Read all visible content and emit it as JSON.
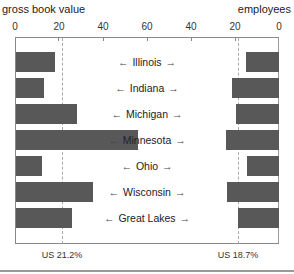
{
  "chart_data": {
    "type": "bar",
    "orientation": "horizontal-butterfly",
    "categories": [
      "Illinois",
      "Indiana",
      "Michigan",
      "Minnesota",
      "Ohio",
      "Wisconsin",
      "Great Lakes"
    ],
    "series": [
      {
        "name": "gross book value",
        "side": "left",
        "values": [
          17.7,
          12.7,
          27.7,
          55.5,
          11.8,
          35.0,
          25.5
        ]
      },
      {
        "name": "employees",
        "side": "right",
        "values": [
          15.0,
          21.4,
          19.5,
          24.1,
          14.5,
          23.6,
          18.6
        ]
      }
    ],
    "left_title": "gross book value",
    "right_title": "employees",
    "left_ticks": [
      "0",
      "20",
      "40",
      "60"
    ],
    "right_ticks": [
      "40",
      "20",
      "0"
    ],
    "xlim_left": [
      0,
      60
    ],
    "xlim_right": [
      0,
      60
    ],
    "reference_lines": [
      {
        "side": "left",
        "value": 21.2,
        "label": "US 21.2%"
      },
      {
        "side": "right",
        "value": 18.7,
        "label": "US 18.7%"
      }
    ],
    "arrow_left": "←",
    "arrow_right": "→",
    "bar_color": "#585858",
    "grid": false,
    "legend": "none"
  }
}
